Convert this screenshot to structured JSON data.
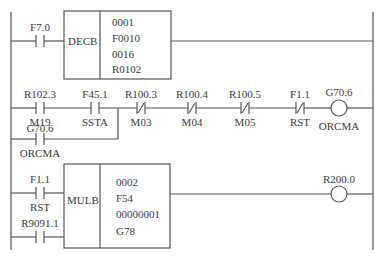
{
  "diagram": {
    "type": "ladder",
    "rungs": [
      {
        "contacts": [
          {
            "address": "F7.0",
            "name": "",
            "type": "NO"
          }
        ],
        "function_block": {
          "name": "DECB",
          "params": [
            "0001",
            "F0010",
            "0016",
            "R0102"
          ]
        }
      },
      {
        "contacts": [
          {
            "address": "R102.3",
            "name": "M19",
            "type": "NO"
          },
          {
            "address": "F45.1",
            "name": "SSTA",
            "type": "NO"
          },
          {
            "address": "R100.3",
            "name": "M03",
            "type": "NC"
          },
          {
            "address": "R100.4",
            "name": "M04",
            "type": "NC"
          },
          {
            "address": "R100.5",
            "name": "M05",
            "type": "NC"
          },
          {
            "address": "F1.1",
            "name": "RST",
            "type": "NC"
          }
        ],
        "branch_contacts": [
          {
            "address": "G70.6",
            "name": "ORCMA",
            "type": "NO"
          }
        ],
        "coil": {
          "address": "G70.6",
          "name": "ORCMA"
        }
      },
      {
        "contacts": [
          {
            "address": "F1.1",
            "name": "RST",
            "type": "NO"
          },
          {
            "address": "R9091.1",
            "name": "",
            "type": "NO"
          }
        ],
        "function_block": {
          "name": "MULB",
          "params": [
            "0002",
            "F54",
            "00000001",
            "G78"
          ]
        },
        "coil": {
          "address": "R200.0",
          "name": ""
        }
      }
    ]
  }
}
